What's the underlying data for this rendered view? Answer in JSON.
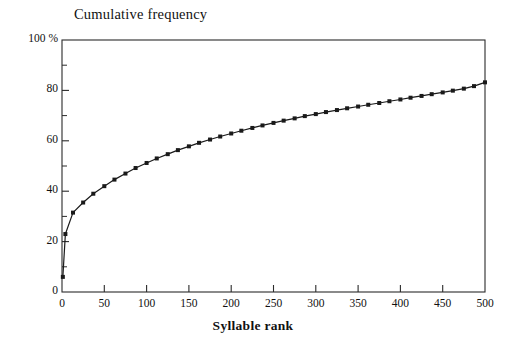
{
  "chart_data": {
    "type": "line",
    "title": "Cumulative frequency",
    "xlabel": "Syllable rank",
    "ylabel": "",
    "ylim": [
      0,
      100
    ],
    "xlim": [
      0,
      500
    ],
    "grid": false,
    "legend": "none",
    "y_unit": "%",
    "y_ticks": [
      0,
      20,
      40,
      60,
      80,
      100
    ],
    "y_tick_labels": [
      "0",
      "20",
      "40",
      "60",
      "80",
      "100 %"
    ],
    "y_minor_ticks": [
      10,
      30,
      50,
      70,
      90
    ],
    "x_ticks": [
      0,
      50,
      100,
      150,
      200,
      250,
      300,
      350,
      400,
      450,
      500
    ],
    "x_tick_labels": [
      "0",
      "50",
      "100",
      "150",
      "200",
      "250",
      "300",
      "350",
      "400",
      "450",
      "500"
    ],
    "marker": "filled-square",
    "line_color": "#1a1a1a",
    "series": [
      {
        "name": "Cumulative frequency of syllables",
        "x": [
          1,
          4,
          13,
          25,
          37,
          50,
          62,
          75,
          87,
          100,
          112,
          125,
          137,
          150,
          162,
          175,
          187,
          200,
          212,
          225,
          237,
          250,
          262,
          275,
          287,
          300,
          312,
          325,
          337,
          350,
          362,
          375,
          387,
          400,
          412,
          425,
          437,
          450,
          462,
          475,
          487,
          500
        ],
        "values": [
          6.0,
          23.0,
          31.5,
          35.5,
          39.0,
          42.0,
          44.6,
          47.0,
          49.2,
          51.2,
          53.0,
          54.7,
          56.3,
          57.8,
          59.2,
          60.5,
          61.7,
          62.9,
          64.0,
          65.1,
          66.1,
          67.1,
          68.0,
          68.9,
          69.8,
          70.6,
          71.4,
          72.2,
          72.9,
          73.6,
          74.3,
          75.0,
          75.7,
          76.4,
          77.1,
          77.8,
          78.5,
          79.2,
          79.9,
          80.7,
          81.7,
          83.2
        ]
      }
    ]
  },
  "figure": {
    "plot_frame_color": "#2b2b2b",
    "background": "#ffffff"
  }
}
